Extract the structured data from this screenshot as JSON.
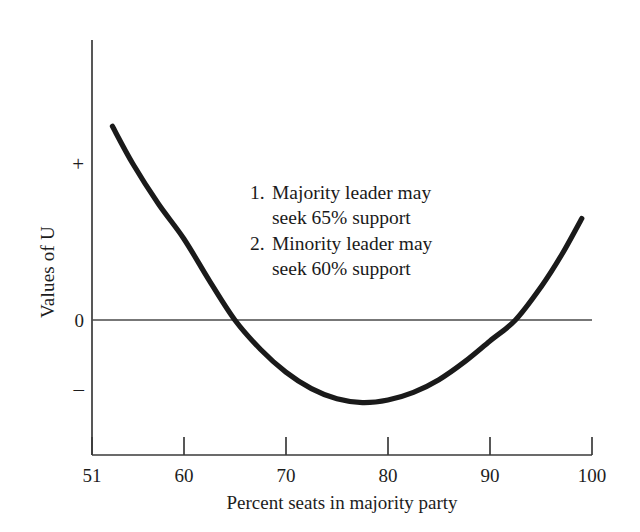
{
  "figure": {
    "background_color": "#ffffff",
    "ink_color": "#1a1a1a",
    "curve_color": "#1a1a1a",
    "axis_color": "#3a3a3a"
  },
  "axes": {
    "x": {
      "title": "Percent seats in majority party",
      "ticks": [
        "51",
        "60",
        "70",
        "80",
        "90",
        "100"
      ],
      "tick_values": [
        51,
        60,
        70,
        80,
        90,
        100
      ],
      "min": 51,
      "max": 100
    },
    "y": {
      "title": "Values of U",
      "ticks": [
        "+",
        "0",
        "–"
      ],
      "tick_names": [
        "plus",
        "zero",
        "minus"
      ]
    }
  },
  "annotation": {
    "items": [
      {
        "number": "1.",
        "line1": "Majority leader may",
        "line2": "seek 65% support"
      },
      {
        "number": "2.",
        "line1": "Minority leader may",
        "line2": "seek 60% support"
      }
    ]
  },
  "chart_data": {
    "type": "line",
    "title": "",
    "subtitle": "",
    "xlabel": "Percent seats in majority party",
    "ylabel": "Values of U",
    "xlim": [
      51,
      100
    ],
    "ylim": [
      -1.55,
      3.1
    ],
    "grid": false,
    "legend": null,
    "xticks": [
      51,
      60,
      70,
      80,
      90,
      100
    ],
    "xticklabels": [
      "51",
      "60",
      "70",
      "80",
      "90",
      "100"
    ],
    "yticks": [
      1.75,
      0,
      -1.05
    ],
    "yticklabels": [
      "+",
      "0",
      "–"
    ],
    "zero_line": 0,
    "series": [
      {
        "name": "U",
        "comment": "Convex U-shaped utility curve; zero crossings near 65 and 92.5, minimum near 77.5",
        "x": [
          53.0,
          55.0,
          57.5,
          60.0,
          62.5,
          65.0,
          67.5,
          70.0,
          72.5,
          75.0,
          77.5,
          80.0,
          82.5,
          85.0,
          87.5,
          90.0,
          92.5,
          95.0,
          97.0,
          99.0
        ],
        "y": [
          3.05,
          2.46,
          1.83,
          1.28,
          0.62,
          0.0,
          -0.46,
          -0.82,
          -1.08,
          -1.24,
          -1.3,
          -1.26,
          -1.14,
          -0.94,
          -0.66,
          -0.33,
          0.0,
          0.52,
          1.02,
          1.6
        ]
      }
    ],
    "annotations": [
      "1. Majority leader may seek 65% support",
      "2. Minority leader may seek 60% support"
    ],
    "markers": {
      "majority_target_percent": 65,
      "minority_target_percent": 60,
      "minimum_percent": 77.5,
      "left_zero_crossing_percent": 65,
      "right_zero_crossing_percent": 92.5
    }
  }
}
